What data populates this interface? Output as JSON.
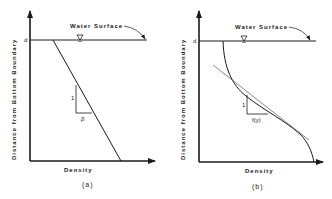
{
  "figure": {
    "panels": [
      {
        "id": "a",
        "caption": "(a)",
        "y_axis_label": "Distance from Bottom Boundary",
        "x_axis_label": "Density",
        "depth_marker": "d",
        "water_surface_label": "Water Surface",
        "profile_type": "linear",
        "slope_triangle": {
          "rise_label": "1",
          "run_label": "β"
        }
      },
      {
        "id": "b",
        "caption": "(b)",
        "y_axis_label": "Distance from Bottom Boundary",
        "x_axis_label": "Density",
        "depth_marker": "d",
        "water_surface_label": "Water Surface",
        "profile_type": "curved with tangent",
        "slope_triangle": {
          "rise_label": "1",
          "run_label": "f(y)"
        }
      }
    ],
    "colors": {
      "line": "#1a1a1a",
      "background": "#ffffff",
      "tangent": "#555555"
    }
  }
}
